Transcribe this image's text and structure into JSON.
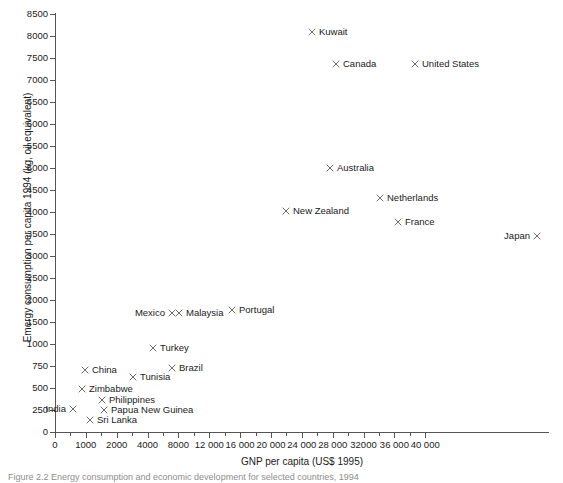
{
  "chart_data": {
    "type": "scatter",
    "title": "",
    "xlabel": "GNP per capita (US$ 1995)",
    "ylabel": "Emergy consumption per capita 1994 (kg, oil equivalent)",
    "grid": false,
    "legend": "none",
    "marker_symbol": "x",
    "marker_color": "#5b5b5b",
    "xlim": [
      0,
      40000
    ],
    "ylim": [
      0,
      9000
    ],
    "x_axis_note": "non-uniform axis: equal pixel spacing between 0-1000-2000 then 2000-4000, then 4000-8000, then 4000-unit steps to 40000",
    "y_axis_note": "non-uniform axis: 250-unit steps from 0 to 1000, then 500-unit steps from 1000 to 9000",
    "xticks": [
      {
        "label": "0",
        "value": 0
      },
      {
        "label": "1000",
        "value": 1000
      },
      {
        "label": "2000",
        "value": 2000
      },
      {
        "label": "4000",
        "value": 4000
      },
      {
        "label": "8000",
        "value": 8000
      },
      {
        "label": "12 000",
        "value": 12000
      },
      {
        "label": "16 000",
        "value": 16000
      },
      {
        "label": "20 000",
        "value": 20000
      },
      {
        "label": "24 000",
        "value": 24000
      },
      {
        "label": "28 000",
        "value": 28000
      },
      {
        "label": "32000",
        "value": 32000
      },
      {
        "label": "36 000",
        "value": 36000
      },
      {
        "label": "40 000",
        "value": 40000
      }
    ],
    "yticks": [
      {
        "label": "0",
        "value": 0
      },
      {
        "label": "250",
        "value": 250
      },
      {
        "label": "500",
        "value": 500
      },
      {
        "label": "750",
        "value": 750
      },
      {
        "label": "1000",
        "value": 1000
      },
      {
        "label": "1500",
        "value": 1500
      },
      {
        "label": "2000",
        "value": 2000
      },
      {
        "label": "2500",
        "value": 2500
      },
      {
        "label": "3000",
        "value": 3000
      },
      {
        "label": "3500",
        "value": 3500
      },
      {
        "label": "4000",
        "value": 4000
      },
      {
        "label": "4500",
        "value": 4500
      },
      {
        "label": "5000",
        "value": 5000
      },
      {
        "label": "5500",
        "value": 5500
      },
      {
        "label": "6000",
        "value": 6000
      },
      {
        "label": "6500",
        "value": 6500
      },
      {
        "label": "7000",
        "value": 7000
      },
      {
        "label": "7500",
        "value": 7500
      },
      {
        "label": "8000",
        "value": 8000
      },
      {
        "label": "8500",
        "value": 8500
      },
      {
        "label": "9000",
        "value": 9000
      }
    ],
    "points": [
      {
        "name": "Kuwait",
        "x": 16300,
        "y": 8560,
        "label_side": "right",
        "px": 312,
        "py": 32
      },
      {
        "name": "Canada",
        "x": 19700,
        "y": 7840,
        "label_side": "right",
        "px": 336,
        "py": 64
      },
      {
        "name": "United States",
        "x": 26700,
        "y": 7840,
        "label_side": "right",
        "px": 415,
        "py": 64
      },
      {
        "name": "Australia",
        "x": 18700,
        "y": 5300,
        "label_side": "right",
        "px": 330,
        "py": 168
      },
      {
        "name": "Netherlands",
        "x": 24500,
        "y": 4620,
        "label_side": "right",
        "px": 380,
        "py": 198
      },
      {
        "name": "New Zealand",
        "x": 14000,
        "y": 4320,
        "label_side": "right",
        "px": 286,
        "py": 211
      },
      {
        "name": "France",
        "x": 26000,
        "y": 4070,
        "label_side": "right",
        "px": 398,
        "py": 222
      },
      {
        "name": "Japan",
        "x": 39800,
        "y": 3750,
        "label_side": "left",
        "px": 537,
        "py": 236
      },
      {
        "name": "Portugal",
        "x": 9400,
        "y": 1830,
        "label_side": "right",
        "px": 232,
        "py": 310
      },
      {
        "name": "Malaysia",
        "x": 3900,
        "y": 1770,
        "label_side": "right",
        "px": 179,
        "py": 313
      },
      {
        "name": "Mexico",
        "x": 3500,
        "y": 1770,
        "label_side": "left",
        "px": 172,
        "py": 313
      },
      {
        "name": "Turkey",
        "x": 2700,
        "y": 970,
        "label_side": "right",
        "px": 153,
        "py": 348
      },
      {
        "name": "Brazil",
        "x": 3900,
        "y": 740,
        "label_side": "right",
        "px": 172,
        "py": 368
      },
      {
        "name": "China",
        "x": 620,
        "y": 660,
        "label_side": "right",
        "px": 85,
        "py": 370
      },
      {
        "name": "Tunisia",
        "x": 1850,
        "y": 640,
        "label_side": "right",
        "px": 133,
        "py": 377
      },
      {
        "name": "Zimbabwe",
        "x": 540,
        "y": 440,
        "label_side": "right",
        "px": 82,
        "py": 389
      },
      {
        "name": "Philippines",
        "x": 1080,
        "y": 340,
        "label_side": "right",
        "px": 102,
        "py": 400
      },
      {
        "name": "India",
        "x": 340,
        "y": 250,
        "label_side": "left",
        "px": 73,
        "py": 409
      },
      {
        "name": "Papua New Guinea",
        "x": 1140,
        "y": 240,
        "label_side": "right",
        "px": 104,
        "py": 410
      },
      {
        "name": "Sri Lanka",
        "x": 690,
        "y": 120,
        "label_side": "right",
        "px": 90,
        "py": 420
      }
    ]
  },
  "caption": "Figure 2.2 Energy consumption and economic development for selected countries, 1994"
}
